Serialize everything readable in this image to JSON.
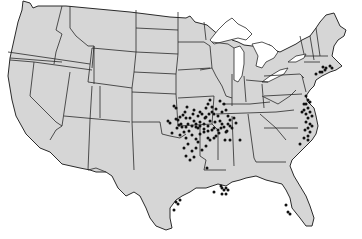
{
  "map": {
    "title": "",
    "region": "Contiguous United States",
    "land_color": "#d6d6d6",
    "border_color": "#2a2a2a",
    "background_color": "#ffffff",
    "marker_color": "#111111",
    "marker_shape": "filled-circle",
    "marker_clusters": [
      {
        "name": "Missouri / Kansas / Oklahoma / Arkansas region",
        "approx_count": 95
      },
      {
        "name": "Mid-Atlantic coast (Maryland / Virginia / North Carolina)",
        "approx_count": 22
      },
      {
        "name": "Southern New England coast",
        "approx_count": 8
      },
      {
        "name": "Louisiana / Mississippi Gulf coast",
        "approx_count": 8
      },
      {
        "name": "Texas Gulf coast",
        "approx_count": 4
      },
      {
        "name": "Florida west coast",
        "approx_count": 3
      }
    ]
  }
}
